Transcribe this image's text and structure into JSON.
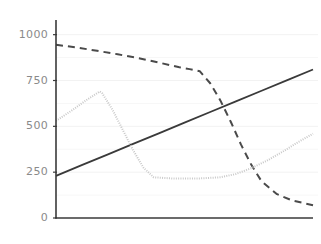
{
  "chart_data": {
    "type": "line",
    "title": "",
    "subtitle": "",
    "xlabel": "",
    "ylabel": "",
    "xlim": [
      0,
      100
    ],
    "ylim": [
      0,
      1080
    ],
    "grid": true,
    "grid_color": "#f2f2f2",
    "legend": "none",
    "y_ticks": [
      0,
      250,
      500,
      750,
      1000
    ],
    "y_tick_labels": [
      "0",
      "250",
      "500",
      "750",
      "1000"
    ],
    "x_ticks": [],
    "x_tick_labels": [],
    "axis_color": "#3a3a3a",
    "tick_label_color": "#8a8a8a",
    "series": [
      {
        "name": "solid-rising-line",
        "style": "solid",
        "color": "#3a3a3a",
        "width": 1.8,
        "x": [
          0,
          10,
          20,
          30,
          40,
          50,
          60,
          70,
          80,
          90,
          100
        ],
        "values": [
          230,
          288,
          346,
          404,
          462,
          520,
          578,
          636,
          694,
          752,
          810
        ]
      },
      {
        "name": "dashed-falling-line",
        "style": "dashed",
        "color": "#4a4a4a",
        "width": 2.0,
        "x": [
          0,
          8,
          16,
          24,
          32,
          40,
          48,
          52,
          56,
          60,
          64,
          68,
          72,
          76,
          80,
          86,
          92,
          100
        ],
        "values": [
          945,
          930,
          912,
          893,
          872,
          848,
          822,
          812,
          800,
          735,
          640,
          525,
          400,
          290,
          200,
          130,
          95,
          70
        ]
      },
      {
        "name": "dotted-gray-line",
        "style": "dotted",
        "color": "#c9c9c9",
        "width": 2.0,
        "x": [
          0,
          6,
          12,
          17,
          18,
          22,
          26,
          30,
          34,
          38,
          46,
          56,
          64,
          70,
          76,
          82,
          88,
          94,
          100
        ],
        "values": [
          530,
          585,
          645,
          690,
          680,
          590,
          480,
          370,
          275,
          222,
          215,
          216,
          222,
          240,
          272,
          312,
          360,
          412,
          460
        ]
      }
    ]
  },
  "figure": {
    "background": "#ffffff",
    "plot_left": 56,
    "plot_right": 313,
    "plot_top": 20,
    "plot_bottom": 218
  }
}
